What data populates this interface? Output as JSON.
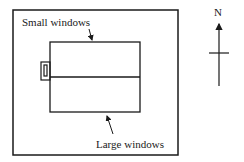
{
  "diagram": {
    "labels": {
      "small_windows": "Small windows",
      "large_windows": "Large windows",
      "north": "N"
    },
    "colors": {
      "stroke": "#1a1a1a",
      "background": "#ffffff"
    },
    "elements": {
      "site_boundary": "outer rectangle",
      "building": "rectangle divided horizontally into north and south halves",
      "entrance": "small box on west wall with inner slot",
      "north_arrow": "arrow pointing up with crossbar"
    }
  }
}
